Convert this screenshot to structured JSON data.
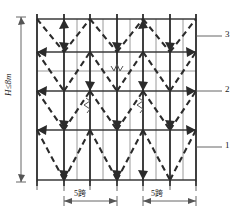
{
  "figure": {
    "type": "engineering-elevation-diagram",
    "colors": {
      "standard_post": "#2b2b2b",
      "secondary_post": "#9a9a9a",
      "ledger": "#3a3a3a",
      "bracing": "#2b2b2b",
      "callout_leader": "#555555",
      "dimension": "#555555",
      "background": "#ffffff"
    },
    "dimensions": {
      "height_label": "H≤8m",
      "span_left_label": "5跨",
      "span_right_label": "5跨"
    },
    "callouts": [
      {
        "id": "1",
        "label": "1",
        "target_y": 147
      },
      {
        "id": "2",
        "label": "2",
        "target_y": 91
      },
      {
        "id": "3",
        "label": "3",
        "target_y": 36
      }
    ],
    "grid": {
      "x_left": 37,
      "x_right": 196,
      "y_top": 19,
      "y_bottom": 180,
      "main_posts_x": [
        37,
        64,
        90,
        117,
        143,
        170,
        196
      ],
      "secondary_posts_x": [
        77,
        103,
        130,
        156,
        183
      ],
      "ledgers_y": [
        19,
        52,
        91,
        130,
        180
      ],
      "secondary_ledger_y": [
        71
      ]
    },
    "break_symbols": [
      {
        "type": "horizontal-break",
        "x": 117,
        "y": 71
      },
      {
        "type": "vertical-break",
        "x": 90,
        "y": 106
      },
      {
        "type": "vertical-break",
        "x": 143,
        "y": 106
      }
    ]
  }
}
